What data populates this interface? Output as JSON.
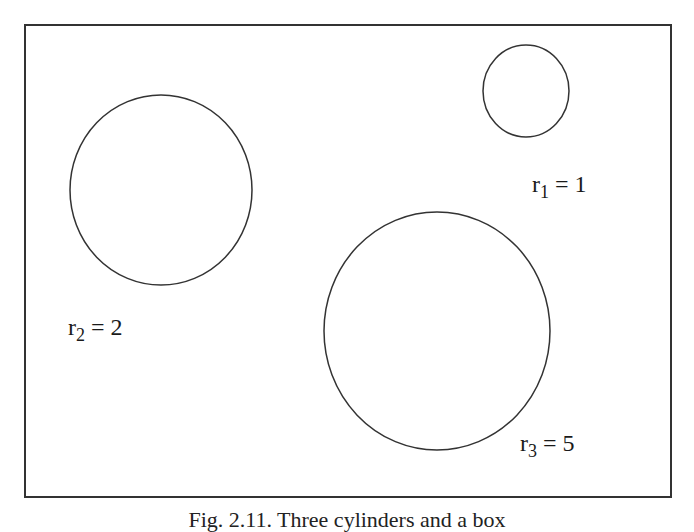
{
  "diagram": {
    "type": "circles-in-frame",
    "frame": {
      "x": 24,
      "y": 24,
      "width": 646,
      "height": 472,
      "stroke": "#333333"
    },
    "circles": [
      {
        "id": "c1",
        "cx": 526,
        "cy": 91,
        "rx": 44,
        "ry": 46,
        "stroke": "#333333",
        "label": {
          "var": "r",
          "sub": "1",
          "rest": " = 1",
          "x": 532,
          "y": 173
        }
      },
      {
        "id": "c2",
        "cx": 161,
        "cy": 190,
        "rx": 91,
        "ry": 95,
        "stroke": "#333333",
        "label": {
          "var": "r",
          "sub": "2",
          "rest": " = 2",
          "x": 68,
          "y": 315
        }
      },
      {
        "id": "c3",
        "cx": 437,
        "cy": 331,
        "rx": 113,
        "ry": 119,
        "stroke": "#333333",
        "label": {
          "var": "r",
          "sub": "3",
          "rest": " = 5",
          "x": 520,
          "y": 431
        }
      }
    ]
  },
  "labels": {
    "r1": {
      "var": "r",
      "sub": "1",
      "rest": " = 1"
    },
    "r2": {
      "var": "r",
      "sub": "2",
      "rest": " = 2"
    },
    "r3": {
      "var": "r",
      "sub": "3",
      "rest": " = 5"
    }
  },
  "caption": {
    "text": "Fig. 2.11. Three cylinders and a box",
    "note": "cropped at bottom edge; only top of glyphs visible"
  }
}
